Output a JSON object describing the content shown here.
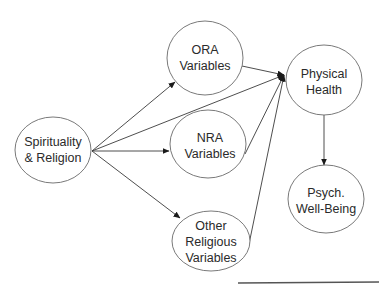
{
  "diagram": {
    "type": "path-model",
    "nodes": [
      {
        "id": "sr",
        "lines": [
          "Spirituality",
          "& Religion"
        ],
        "cx": 53,
        "cy": 150,
        "rx": 38,
        "ry": 33
      },
      {
        "id": "ora",
        "lines": [
          "ORA",
          "Variables"
        ],
        "cx": 205,
        "cy": 58,
        "rx": 38,
        "ry": 37
      },
      {
        "id": "nra",
        "lines": [
          "NRA",
          "Variables"
        ],
        "cx": 208,
        "cy": 144,
        "rx": 38,
        "ry": 34
      },
      {
        "id": "other",
        "lines": [
          "Other",
          "Religious",
          "Variables"
        ],
        "cx": 211,
        "cy": 241,
        "rx": 39,
        "ry": 30
      },
      {
        "id": "ph",
        "lines": [
          "Physical",
          "Health"
        ],
        "cx": 324,
        "cy": 80,
        "rx": 38,
        "ry": 35
      },
      {
        "id": "pwb",
        "lines": [
          "Psych.",
          "Well-Being"
        ],
        "cx": 326,
        "cy": 199,
        "rx": 38,
        "ry": 34
      }
    ],
    "edges": [
      {
        "from": "sr",
        "to": "ora",
        "x1": 92,
        "y1": 151,
        "x2": 175,
        "y2": 82
      },
      {
        "from": "sr",
        "to": "ph",
        "x1": 92,
        "y1": 151,
        "x2": 284,
        "y2": 75
      },
      {
        "from": "sr",
        "to": "nra",
        "x1": 92,
        "y1": 151,
        "x2": 169,
        "y2": 151
      },
      {
        "from": "sr",
        "to": "other",
        "x1": 92,
        "y1": 151,
        "x2": 180,
        "y2": 218
      },
      {
        "from": "ora",
        "to": "ph",
        "x1": 242,
        "y1": 66,
        "x2": 284,
        "y2": 75
      },
      {
        "from": "nra",
        "to": "ph",
        "x1": 245,
        "y1": 154,
        "x2": 284,
        "y2": 75
      },
      {
        "from": "other",
        "to": "ph",
        "x1": 249,
        "y1": 244,
        "x2": 284,
        "y2": 75
      },
      {
        "from": "ph",
        "to": "pwb",
        "x1": 324,
        "y1": 115,
        "x2": 324,
        "y2": 165
      }
    ],
    "baseline": {
      "x1": 238,
      "y1": 283,
      "x2": 379,
      "y2": 282
    },
    "colors": {
      "node_stroke": "#6a6a6a",
      "edge": "#3a3a3a",
      "text": "#2a2a2a",
      "background": "#ffffff"
    },
    "labels": {
      "sr_1": "Spirituality",
      "sr_2": "& Religion",
      "ora_1": "ORA",
      "ora_2": "Variables",
      "nra_1": "NRA",
      "nra_2": "Variables",
      "other_1": "Other",
      "other_2": "Religious",
      "other_3": "Variables",
      "ph_1": "Physical",
      "ph_2": "Health",
      "pwb_1": "Psych.",
      "pwb_2": "Well-Being"
    }
  }
}
